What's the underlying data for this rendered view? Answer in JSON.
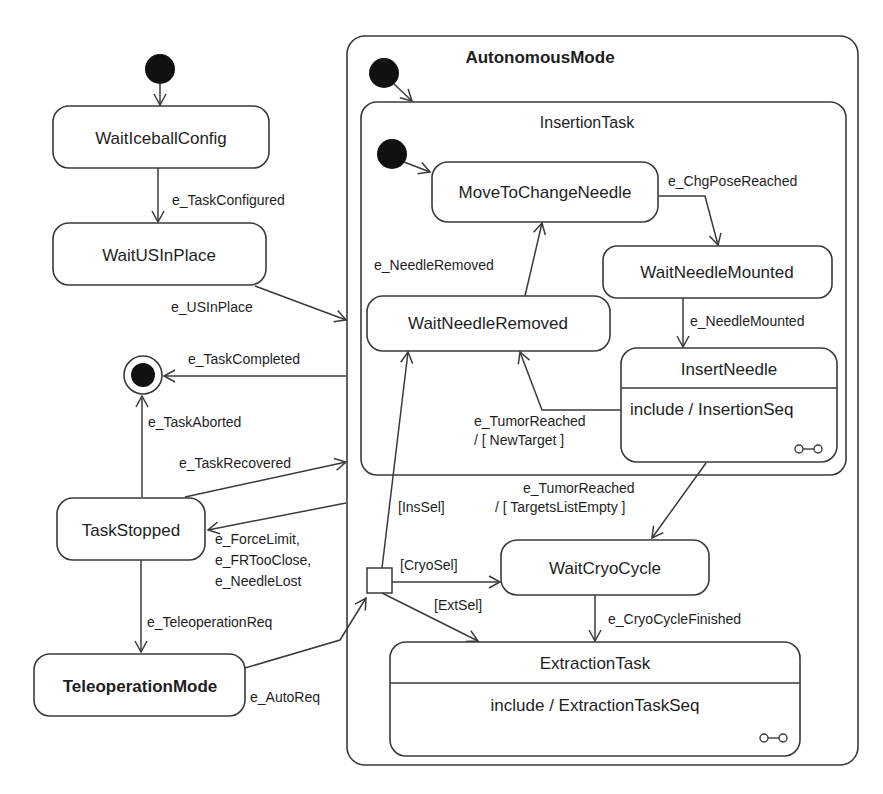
{
  "diagram": {
    "type": "UML state machine",
    "composites": {
      "autonomous_mode": {
        "title": "AutonomousMode"
      },
      "insertion_task": {
        "title": "InsertionTask"
      }
    },
    "states": {
      "wait_iceball_config": "WaitIceballConfig",
      "wait_us_in_place": "WaitUSInPlace",
      "task_stopped": "TaskStopped",
      "teleoperation_mode": "TeleoperationMode",
      "move_to_change_needle": "MoveToChangeNeedle",
      "wait_needle_mounted": "WaitNeedleMounted",
      "wait_needle_removed": "WaitNeedleRemoved",
      "insert_needle": {
        "name": "InsertNeedle",
        "activity": "include / InsertionSeq"
      },
      "wait_cryo_cycle": "WaitCryoCycle",
      "extraction_task": {
        "name": "ExtractionTask",
        "activity": "include / ExtractionTaskSeq"
      }
    },
    "transitions": {
      "task_configured": "e_TaskConfigured",
      "us_in_place": "e_USInPlace",
      "task_completed": "e_TaskCompleted",
      "task_aborted": "e_TaskAborted",
      "task_recovered": "e_TaskRecovered",
      "stop_events": [
        "e_ForceLimit,",
        "e_FRTooClose,",
        "e_NeedleLost"
      ],
      "teleoperation_req": "e_TeleoperationReq",
      "auto_req": "e_AutoReq",
      "chg_pose_reached": "e_ChgPoseReached",
      "needle_mounted": "e_NeedleMounted",
      "needle_removed": "e_NeedleRemoved",
      "tumor_reached_new": [
        "e_TumorReached",
        "/ [ NewTarget ]"
      ],
      "tumor_reached_empty": [
        "e_TumorReached",
        "/ [ TargetsListEmpty ]"
      ],
      "ins_sel": "[InsSel]",
      "cryo_sel": "[CryoSel]",
      "ext_sel": "[ExtSel]",
      "cryo_cycle_finished": "e_CryoCycleFinished"
    }
  }
}
